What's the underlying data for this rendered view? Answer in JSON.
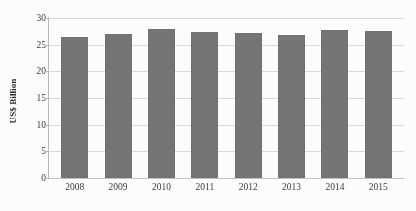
{
  "chart_data": {
    "type": "bar",
    "title": "",
    "subtitle": "",
    "xlabel": "",
    "ylabel": "US$ Billion",
    "categories": [
      "2008",
      "2009",
      "2010",
      "2011",
      "2012",
      "2013",
      "2014",
      "2015"
    ],
    "values": [
      26.5,
      27.0,
      28.0,
      27.3,
      27.2,
      26.8,
      27.8,
      27.5
    ],
    "series": [
      {
        "name": "",
        "values": [
          26.5,
          27.0,
          28.0,
          27.3,
          27.2,
          26.8,
          27.8,
          27.5
        ]
      }
    ],
    "ylim": [
      0,
      30
    ],
    "y_ticks": [
      0,
      5,
      10,
      15,
      20,
      25,
      30
    ],
    "y_tick_labels": [
      "0",
      "5",
      "10",
      "15",
      "20",
      "25",
      "30"
    ],
    "grid": "horizontal",
    "legend": "none",
    "bar_color": "#757575",
    "gridline_color": "#d9d9d9",
    "axis_color": "#b9b9b9",
    "background_color": "#fdfdfd",
    "annotations": []
  }
}
